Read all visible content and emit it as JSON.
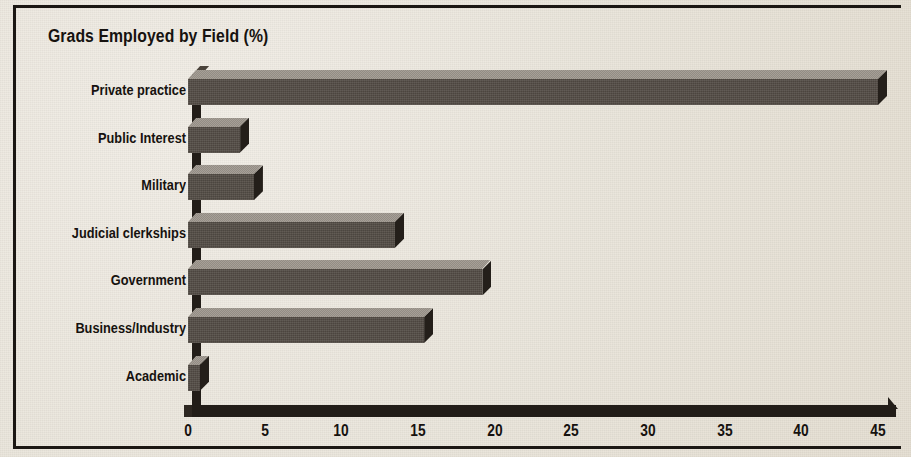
{
  "chart_data": {
    "type": "bar",
    "orientation": "horizontal",
    "title": "Grads Employed by Field (%)",
    "xlabel": "",
    "ylabel": "",
    "categories": [
      "Private practice",
      "Public Interest",
      "Military",
      "Judicial clerkships",
      "Government",
      "Business/Industry",
      "Academic"
    ],
    "values": [
      45,
      3.4,
      4.3,
      13.5,
      19.2,
      15.4,
      0.8
    ],
    "xlim": [
      0,
      45
    ],
    "xticks": [
      0,
      5,
      10,
      15,
      20,
      25,
      30,
      35,
      40,
      45
    ],
    "xtick_labels": [
      "0",
      "5",
      "10",
      "15",
      "20",
      "25",
      "30",
      "35",
      "40",
      "45"
    ],
    "grid": false,
    "legend": false,
    "style": "3d-bars",
    "colors": {
      "bar_front": "#534c45",
      "bar_top": "#9c958c",
      "bar_side": "#241f1a",
      "axis": "#221d18",
      "background": "#e9e4da",
      "text": "#16120f"
    }
  },
  "figure": {
    "title": "Grads Employed by Field (%)"
  }
}
